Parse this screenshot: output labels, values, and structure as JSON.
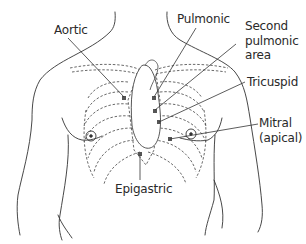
{
  "diagram": {
    "labels": {
      "aortic": "Aortic",
      "pulmonic": "Pulmonic",
      "second_pulmonic_l1": "Second",
      "second_pulmonic_l2": "pulmonic",
      "second_pulmonic_l3": "area",
      "tricuspid": "Tricuspid",
      "mitral_l1": "Mitral",
      "mitral_l2": "(apical)",
      "epigastric": "Epigastric"
    },
    "colors": {
      "line": "#333333",
      "background": "#ffffff"
    }
  }
}
